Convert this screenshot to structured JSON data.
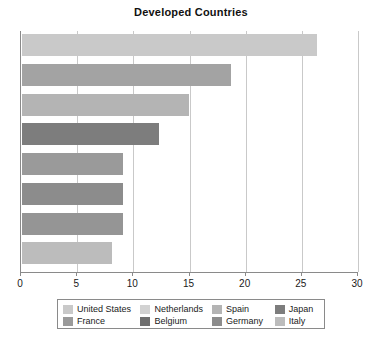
{
  "chart_data": {
    "type": "bar",
    "orientation": "horizontal",
    "title": "Developed Countries",
    "xlabel": "",
    "ylabel": "",
    "xlim": [
      0,
      30
    ],
    "xticks": [
      0,
      5,
      10,
      15,
      20,
      25,
      30
    ],
    "xtick_labels": [
      "0",
      "5",
      "10",
      "15",
      "20",
      "25",
      "30"
    ],
    "grid": true,
    "grid_axis": "x",
    "legend_position": "bottom",
    "legend_columns": 4,
    "categories": [
      "United States",
      "Netherlands",
      "Spain",
      "Japan",
      "France",
      "Belgium",
      "Germany",
      "Italy"
    ],
    "values": [
      26.3,
      18.6,
      14.9,
      12.2,
      9.0,
      9.0,
      9.0,
      8.0
    ],
    "colors": [
      "#c9c9c9",
      "#a3a3a3",
      "#b4b4b4",
      "#7d7d7d",
      "#9a9a9a",
      "#8c8c8c",
      "#959595",
      "#bcbcbc"
    ],
    "bars": [
      {
        "label": "United States",
        "value": 26.3,
        "color": "#c9c9c9"
      },
      {
        "label": "Netherlands",
        "value": 18.6,
        "color": "#a3a3a3"
      },
      {
        "label": "Spain",
        "value": 14.9,
        "color": "#b4b4b4"
      },
      {
        "label": "Japan",
        "value": 12.2,
        "color": "#7d7d7d"
      },
      {
        "label": "France",
        "value": 9.0,
        "color": "#9a9a9a"
      },
      {
        "label": "Belgium",
        "value": 9.0,
        "color": "#8c8c8c"
      },
      {
        "label": "Germany",
        "value": 9.0,
        "color": "#959595"
      },
      {
        "label": "Italy",
        "value": 8.0,
        "color": "#bcbcbc"
      }
    ],
    "legend": [
      {
        "label": "United States",
        "color": "#c9c9c9"
      },
      {
        "label": "Netherlands",
        "color": "#d2d2d2"
      },
      {
        "label": "Spain",
        "color": "#b4b4b4"
      },
      {
        "label": "Japan",
        "color": "#7d7d7d"
      },
      {
        "label": "France",
        "color": "#9a9a9a"
      },
      {
        "label": "Belgium",
        "color": "#6f6f6f"
      },
      {
        "label": "Germany",
        "color": "#8c8c8c"
      },
      {
        "label": "Italy",
        "color": "#bcbcbc"
      }
    ]
  },
  "axis_color": "#8a8a8a",
  "grid_color": "#c9c9c9"
}
